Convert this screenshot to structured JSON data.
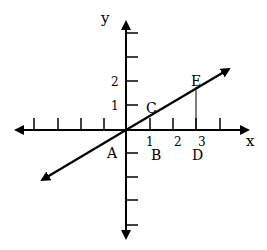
{
  "diagram": {
    "axes": {
      "x_label": "x",
      "y_label": "y",
      "x_tick_labels": [
        "1",
        "2",
        "3"
      ],
      "y_tick_labels": [
        "1",
        "2"
      ]
    },
    "points": {
      "A": "A",
      "B": "B",
      "C": "C",
      "D": "D",
      "E": "E"
    },
    "colors": {
      "stroke": "#000000",
      "background": "#ffffff"
    }
  }
}
